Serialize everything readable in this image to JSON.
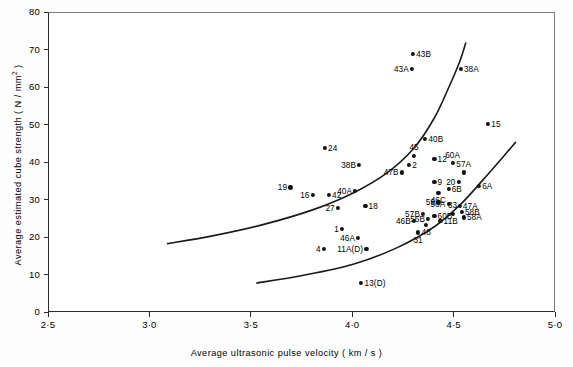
{
  "chart_data": {
    "type": "scatter",
    "title": "",
    "xlabel": "Average  ultrasonic  pulse  velocity  ( km / s )",
    "ylabel": "Average  estimated  cube  strength  ( N / mm² )",
    "xlim": [
      2.5,
      5.0
    ],
    "ylim": [
      0,
      80
    ],
    "xticks": [
      "2·5",
      "3·0",
      "3·5",
      "4·0",
      "4·5",
      "5·0"
    ],
    "xtick_values": [
      2.5,
      3.0,
      3.5,
      4.0,
      4.5,
      5.0
    ],
    "yticks": [
      "0",
      "10",
      "20",
      "30",
      "40",
      "50",
      "60",
      "70",
      "80"
    ],
    "ytick_values": [
      0,
      10,
      20,
      30,
      40,
      50,
      60,
      70,
      80
    ],
    "grid": false,
    "legend": false,
    "marker_color": "#111111",
    "curve_color": "#1a1a1a",
    "points": [
      {
        "label": "43B",
        "x": 4.295,
        "y": 69.0,
        "pos": "r"
      },
      {
        "label": "43A",
        "x": 4.29,
        "y": 65.0,
        "pos": "l"
      },
      {
        "label": "38A",
        "x": 4.53,
        "y": 65.0,
        "pos": "r"
      },
      {
        "label": "15",
        "x": 4.665,
        "y": 50.5,
        "pos": "r"
      },
      {
        "label": "40B",
        "x": 4.355,
        "y": 46.5,
        "pos": "r"
      },
      {
        "label": "24",
        "x": 3.86,
        "y": 44.0,
        "pos": "r"
      },
      {
        "label": "45",
        "x": 4.3,
        "y": 42.0,
        "pos": "t"
      },
      {
        "label": "12",
        "x": 4.4,
        "y": 41.0,
        "pos": "r"
      },
      {
        "label": "60A",
        "x": 4.49,
        "y": 40.0,
        "pos": "t"
      },
      {
        "label": "38B",
        "x": 4.03,
        "y": 39.5,
        "pos": "l"
      },
      {
        "label": "2",
        "x": 4.275,
        "y": 39.5,
        "pos": "r"
      },
      {
        "label": "57A",
        "x": 4.545,
        "y": 37.5,
        "pos": "t"
      },
      {
        "label": "47B",
        "x": 4.24,
        "y": 37.5,
        "pos": "l"
      },
      {
        "label": "20",
        "x": 4.52,
        "y": 35.0,
        "pos": "l"
      },
      {
        "label": "9",
        "x": 4.4,
        "y": 35.0,
        "pos": "r"
      },
      {
        "label": "6A",
        "x": 4.62,
        "y": 34.0,
        "pos": "r"
      },
      {
        "label": "46C",
        "x": 4.42,
        "y": 32.0,
        "pos": "b"
      },
      {
        "label": "6B",
        "x": 4.47,
        "y": 33.0,
        "pos": "r"
      },
      {
        "label": "19",
        "x": 3.69,
        "y": 33.5,
        "pos": "l"
      },
      {
        "label": "40A",
        "x": 4.01,
        "y": 32.5,
        "pos": "l"
      },
      {
        "label": "16",
        "x": 3.8,
        "y": 31.5,
        "pos": "l"
      },
      {
        "label": "42",
        "x": 3.88,
        "y": 31.5,
        "pos": "r"
      },
      {
        "label": "59",
        "x": 4.42,
        "y": 29.5,
        "pos": "l"
      },
      {
        "label": "56A",
        "x": 4.47,
        "y": 29.0,
        "pos": "l"
      },
      {
        "label": "47A",
        "x": 4.525,
        "y": 28.5,
        "pos": "r"
      },
      {
        "label": "58B",
        "x": 4.535,
        "y": 27.0,
        "pos": "r"
      },
      {
        "label": "33",
        "x": 4.49,
        "y": 26.5,
        "pos": "t"
      },
      {
        "label": "58A",
        "x": 4.545,
        "y": 25.5,
        "pos": "r"
      },
      {
        "label": "18",
        "x": 4.06,
        "y": 28.5,
        "pos": "r"
      },
      {
        "label": "27",
        "x": 3.925,
        "y": 28.0,
        "pos": "l"
      },
      {
        "label": "57B",
        "x": 4.345,
        "y": 26.5,
        "pos": "l"
      },
      {
        "label": "60B",
        "x": 4.4,
        "y": 26.0,
        "pos": "r"
      },
      {
        "label": "56B",
        "x": 4.37,
        "y": 25.0,
        "pos": "l"
      },
      {
        "label": "11B",
        "x": 4.43,
        "y": 24.5,
        "pos": "r"
      },
      {
        "label": "46B",
        "x": 4.3,
        "y": 24.5,
        "pos": "l"
      },
      {
        "label": "48",
        "x": 4.36,
        "y": 23.5,
        "pos": "b"
      },
      {
        "label": "1",
        "x": 3.945,
        "y": 22.5,
        "pos": "l"
      },
      {
        "label": "46A",
        "x": 4.025,
        "y": 20.0,
        "pos": "l"
      },
      {
        "label": "31",
        "x": 4.32,
        "y": 21.5,
        "pos": "b"
      },
      {
        "label": "11A(D)",
        "x": 4.065,
        "y": 17.0,
        "pos": "l"
      },
      {
        "label": "4",
        "x": 3.855,
        "y": 17.0,
        "pos": "l"
      },
      {
        "label": "13(D)",
        "x": 4.04,
        "y": 8.0,
        "pos": "r"
      }
    ],
    "curves": [
      {
        "name": "upper-boundary-curve",
        "points": [
          [
            3.085,
            18.5
          ],
          [
            3.3,
            20.5
          ],
          [
            3.55,
            23.5
          ],
          [
            3.8,
            27.5
          ],
          [
            4.0,
            32.0
          ],
          [
            4.17,
            37.5
          ],
          [
            4.3,
            44.0
          ],
          [
            4.4,
            52.0
          ],
          [
            4.47,
            60.0
          ],
          [
            4.525,
            67.0
          ],
          [
            4.555,
            72.0
          ]
        ]
      },
      {
        "name": "lower-boundary-curve",
        "points": [
          [
            3.525,
            8.0
          ],
          [
            3.75,
            10.0
          ],
          [
            4.0,
            13.0
          ],
          [
            4.22,
            17.5
          ],
          [
            4.4,
            23.0
          ],
          [
            4.53,
            29.0
          ],
          [
            4.64,
            35.5
          ],
          [
            4.745,
            42.0
          ],
          [
            4.8,
            45.5
          ]
        ]
      }
    ]
  },
  "axes": {
    "x_title": "Average  ultrasonic  pulse  velocity  ( km / s )",
    "y_title_main": "Average  estimated  cube  strength  ( N / mm",
    "y_title_sup": "2",
    "y_title_tail": " )"
  }
}
